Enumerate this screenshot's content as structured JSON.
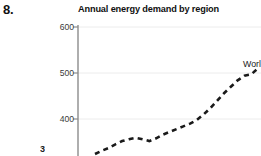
{
  "item_number": "8.",
  "chart_title": "Annual energy demand by region",
  "series_label": "World",
  "x_axis_clipped_label": "3",
  "axis": {
    "y_ticks": [
      "600",
      "500",
      "400"
    ],
    "axis_color": "#8c8c8c",
    "grid_color": "#ececec",
    "line_color": "#1a1a1a"
  },
  "chart_data": {
    "type": "line",
    "title": "Annual energy demand by region",
    "xlabel": "",
    "ylabel": "",
    "ylim": [
      320,
      620
    ],
    "yticks": [
      400,
      500,
      600
    ],
    "grid": true,
    "legend": "inline-right",
    "note": "View is cropped: top/left of plot visible, x-axis tick labels cut off at bottom, series label clipped at right edge",
    "series": [
      {
        "name": "World",
        "style": "dashed",
        "color": "#1a1a1a",
        "values": [
          324,
          331,
          337,
          345,
          352,
          356,
          359,
          356,
          352,
          358,
          366,
          372,
          378,
          384,
          390,
          398,
          410,
          424,
          440,
          456,
          470,
          484,
          494,
          497,
          510
        ]
      }
    ]
  }
}
